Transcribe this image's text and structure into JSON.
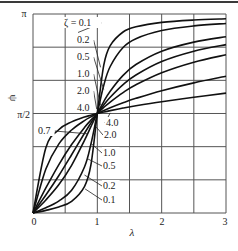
{
  "chart_data": {
    "type": "line",
    "title": "",
    "xlabel": "λ",
    "ylabel": "ψ",
    "xlim": [
      0,
      3
    ],
    "ylim": [
      0,
      3.14159
    ],
    "grid": true,
    "x_ticks": [
      {
        "value": 0,
        "label": "0"
      },
      {
        "value": 1,
        "label": "1"
      },
      {
        "value": 2,
        "label": "2"
      },
      {
        "value": 3,
        "label": "3"
      }
    ],
    "x_gridlines": [
      0,
      0.5,
      1,
      1.5,
      2,
      2.5,
      3
    ],
    "y_ticks": [
      {
        "value": 1.5708,
        "label": "π/2"
      },
      {
        "value": 3.14159,
        "label": "π"
      }
    ],
    "y_gridlines": [
      0,
      0.5236,
      1.0472,
      1.5708,
      2.0944,
      2.618,
      3.14159
    ],
    "parameter_symbol": "ζ",
    "x": [
      0,
      0.2,
      0.4,
      0.6,
      0.8,
      0.9,
      1.0,
      1.1,
      1.2,
      1.4,
      1.6,
      2.0,
      2.5,
      3.0
    ],
    "series": [
      {
        "name": "ζ = 0.1",
        "zeta": 0.1,
        "values": [
          0,
          0.0416,
          0.095,
          0.1853,
          0.4182,
          0.7581,
          1.5708,
          2.3332,
          2.642,
          2.8578,
          2.9393,
          3.009,
          3.0466,
          3.0667
        ]
      },
      {
        "name": "ζ = 0.2",
        "zeta": 0.2,
        "values": [
          0,
          0.0831,
          0.1882,
          0.3588,
          0.7266,
          1.0856,
          1.5708,
          2.0162,
          2.3128,
          2.6135,
          2.7522,
          2.881,
          2.9534,
          2.9927
        ]
      },
      {
        "name": "ζ = 0.5",
        "zeta": 0.5,
        "values": [
          0,
          0.2054,
          0.4444,
          0.7532,
          1.1479,
          1.3628,
          1.5708,
          1.7594,
          1.9222,
          2.1719,
          2.3435,
          2.5536,
          2.6972,
          2.7828
        ]
      },
      {
        "name": "ζ = 0.7",
        "zeta": 0.7,
        "values": [
          0,
          0.2838,
          0.588,
          0.9196,
          1.2593,
          1.4211,
          1.5708,
          1.7063,
          1.8269,
          2.0264,
          2.179,
          2.3911,
          2.5536,
          2.6582
        ]
      },
      {
        "name": "ζ = 1.0",
        "zeta": 1.0,
        "values": [
          0,
          0.3948,
          0.761,
          1.0808,
          1.3495,
          1.4656,
          1.5708,
          1.666,
          1.7521,
          1.9011,
          2.0243,
          2.2143,
          2.3806,
          2.4981
        ]
      },
      {
        "name": "ζ = 2.0",
        "zeta": 2.0,
        "values": [
          0,
          0.6947,
          1.0875,
          1.3102,
          1.4588,
          1.5181,
          1.5708,
          1.6185,
          1.6622,
          1.7406,
          1.8098,
          1.9296,
          2.0541,
          2.1588
        ]
      },
      {
        "name": "ζ = 4.0",
        "zeta": 4.0,
        "values": [
          0,
          1.0304,
          1.3147,
          1.4382,
          1.5146,
          1.5444,
          1.5708,
          1.5947,
          1.6166,
          1.6563,
          1.6921,
          1.7562,
          1.8269,
          1.8926
        ]
      }
    ],
    "annotations_upper_left": [
      {
        "text": "ζ = 0.1",
        "x": 64,
        "y": 26,
        "leader_to": [
          0.7,
          2.85
        ]
      },
      {
        "text": "0.2",
        "x": 77,
        "y": 43,
        "leader_to": [
          1.05,
          2.3
        ]
      },
      {
        "text": "0.5",
        "x": 77,
        "y": 60,
        "leader_to": [
          1.1,
          1.95
        ]
      },
      {
        "text": "1.0",
        "x": 77,
        "y": 77,
        "leader_to": [
          1.05,
          1.7
        ]
      },
      {
        "text": "2.0",
        "x": 77,
        "y": 94,
        "leader_to": [
          0.99,
          1.64
        ]
      },
      {
        "text": "4.0",
        "x": 77,
        "y": 111,
        "leader_to": null
      }
    ],
    "annotations_lower": [
      {
        "text": "0.7",
        "x": 38,
        "y": 134,
        "leader_to": [
          0.85,
          1.25
        ]
      },
      {
        "text": "4.0",
        "x": 106,
        "y": 126,
        "leader_to": [
          1.2,
          1.58
        ]
      },
      {
        "text": "2.0",
        "x": 104,
        "y": 138,
        "leader_to": [
          0.98,
          1.36
        ]
      },
      {
        "text": "1.0",
        "x": 103,
        "y": 156,
        "leader_to": [
          0.9,
          1.1
        ]
      },
      {
        "text": "0.5",
        "x": 103,
        "y": 169,
        "leader_to": [
          0.84,
          0.86
        ]
      },
      {
        "text": "0.2",
        "x": 103,
        "y": 189,
        "leader_to": [
          0.8,
          0.6
        ]
      },
      {
        "text": "0.1",
        "x": 103,
        "y": 203,
        "leader_to": [
          0.81,
          0.38
        ]
      }
    ]
  },
  "labels": {
    "y_axis": "ψ",
    "x_axis": "λ",
    "y_pi": "π",
    "y_half_pi": "π/2",
    "x0": "0",
    "x1": "1",
    "x2": "2",
    "x3": "3"
  }
}
